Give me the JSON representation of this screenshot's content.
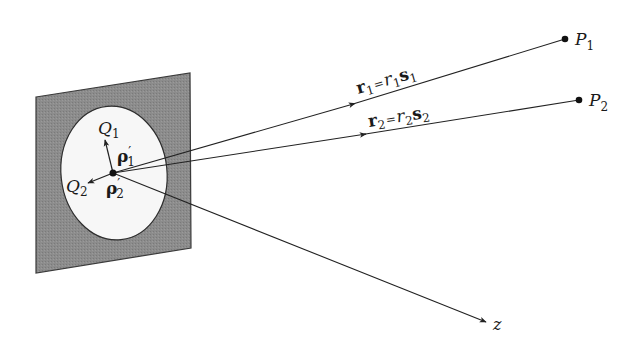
{
  "diagram": {
    "colors": {
      "background": "#ffffff",
      "plate_fill": "#8c8c8c",
      "plate_stroke": "#3a3a3a",
      "aperture_fill": "#f7f7f7",
      "line": "#222222",
      "point": "#111111"
    },
    "plate": {
      "corners": [
        [
          36,
          97
        ],
        [
          190,
          73
        ],
        [
          191,
          248
        ],
        [
          36,
          273
        ]
      ]
    },
    "aperture": {
      "cx": 114,
      "cy": 173,
      "rx": 53,
      "ry": 67,
      "rotate": -6
    },
    "origin": {
      "x": 113,
      "y": 173
    },
    "points": [
      {
        "id": "P1",
        "x": 565,
        "y": 39,
        "label_main": "P",
        "label_sub": "1"
      },
      {
        "id": "P2",
        "x": 579,
        "y": 100,
        "label_main": "P",
        "label_sub": "2"
      }
    ],
    "rays": [
      {
        "id": "r1",
        "to": "P1",
        "arrow_at": [
          355,
          103
        ],
        "label": {
          "bold": "r",
          "sub": "1",
          "eq": "=",
          "it": "r",
          "it_sub": "1",
          "bold2": "s",
          "bold2_sub": "1"
        }
      },
      {
        "id": "r2",
        "to": "P2",
        "arrow_at": [
          366,
          134
        ],
        "label": {
          "bold": "r",
          "sub": "2",
          "eq": "=",
          "it": "r",
          "it_sub": "2",
          "bold2": "s",
          "bold2_sub": "2"
        }
      }
    ],
    "z_axis": {
      "x2": 487,
      "y2": 322,
      "label": "z"
    },
    "aperture_vectors": [
      {
        "id": "Q1",
        "tip": [
          105,
          139
        ],
        "point_label_main": "Q",
        "point_label_sub": "1",
        "vector_label": "ρ",
        "vector_prime": "′",
        "vector_sub": "1"
      },
      {
        "id": "Q2",
        "tip": [
          87,
          183
        ],
        "point_label_main": "Q",
        "point_label_sub": "2",
        "vector_label": "ρ",
        "vector_prime": "′",
        "vector_sub": "2"
      }
    ]
  }
}
